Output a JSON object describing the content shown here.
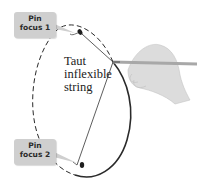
{
  "figure": {
    "type": "illustration"
  },
  "labels": {
    "focus1": {
      "line1": "Pin",
      "line2": "focus 1"
    },
    "focus2": {
      "line1": "Pin",
      "line2": "focus 2"
    },
    "string": {
      "line1": "Taut",
      "line2": "inflexible",
      "line3": "string"
    }
  },
  "colors": {
    "label_bg": "#cfcfcf",
    "outline": "#2a2a2a",
    "hand": "#d9d9d9",
    "pencil": "#b0b0b0"
  }
}
